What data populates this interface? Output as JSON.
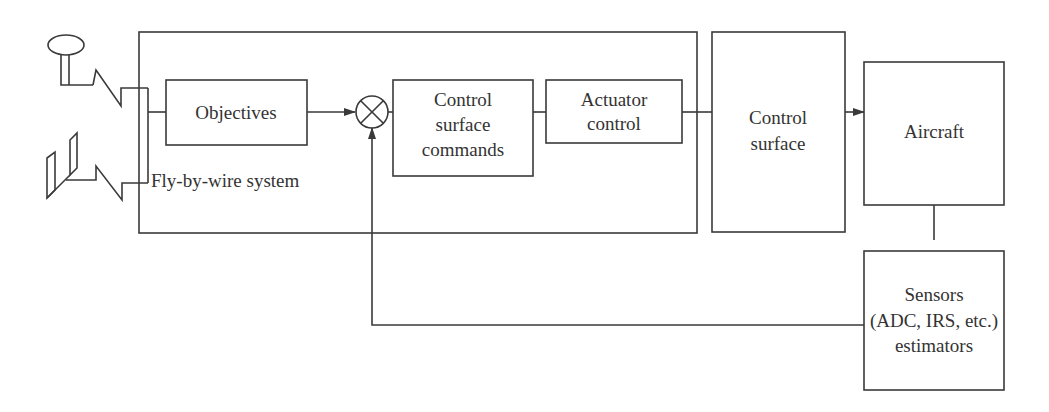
{
  "diagram": {
    "system_label": "Fly-by-wire system",
    "blocks": {
      "objectives": "Objectives",
      "commands": [
        "Control",
        "surface",
        "commands"
      ],
      "actuator": [
        "Actuator",
        "control"
      ],
      "control_surface": [
        "Control",
        "surface"
      ],
      "aircraft": "Aircraft",
      "sensors": [
        "Sensors",
        "(ADC, IRS, etc.)",
        "estimators"
      ]
    },
    "inputs": [
      "pilot-stick",
      "rudder-pedals"
    ],
    "colors": {
      "stroke": "#3a3a3a",
      "text": "#333333",
      "background": "#ffffff"
    }
  }
}
